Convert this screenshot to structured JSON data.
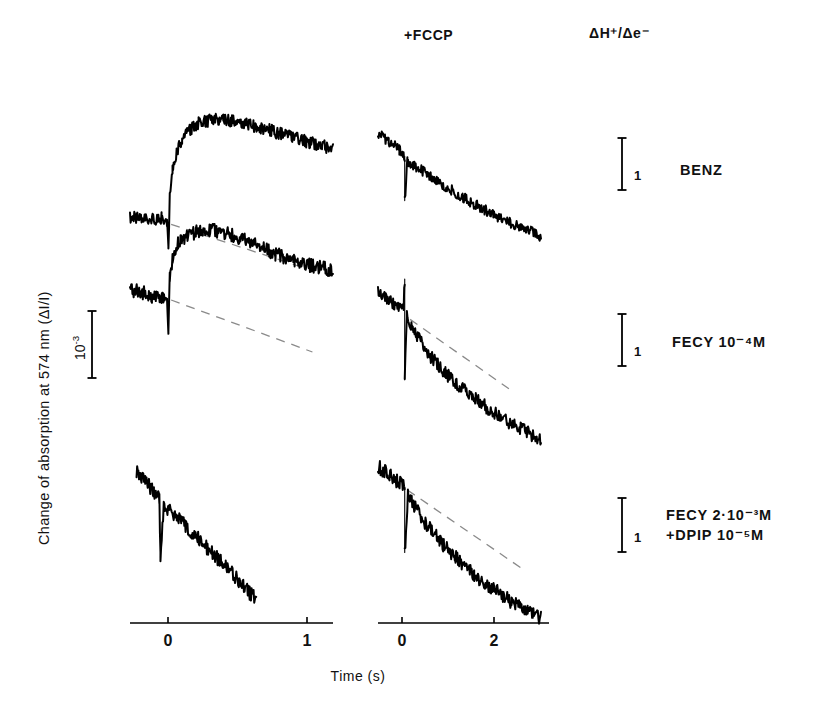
{
  "figure": {
    "axes": {
      "y_label": "Change of absorption at 574 nm (ΔI/I)",
      "y_scale_value": "10",
      "y_scale_exponent": "-3",
      "x_title": "Time (s)",
      "left_ticks": [
        "0",
        "1"
      ],
      "right_ticks": [
        "0",
        "2"
      ]
    },
    "column_headers": {
      "left": "",
      "middle": "+FCCP",
      "right": "ΔH⁺/Δe⁻"
    },
    "rows": [
      {
        "id": "benz",
        "label_lines": [
          "BENZ"
        ],
        "scale_bar_label": "1"
      },
      {
        "id": "fecy-1e-4",
        "label_lines": [
          "FECY 10⁻⁴M"
        ],
        "scale_bar_label": "1"
      },
      {
        "id": "fecy-2e-3-dpip",
        "label_lines": [
          "FECY 2·10⁻³M",
          "+DPIP 10⁻⁵M"
        ],
        "scale_bar_label": "1"
      }
    ]
  },
  "chart_data": {
    "type": "line",
    "title": "",
    "xlabel": "Time (s)",
    "ylabel": "Change of absorption at 574 nm (ΔI/I)",
    "grid": false,
    "legend_position": "right",
    "panels": [
      {
        "row": "BENZ",
        "column": "control",
        "xlim": [
          -0.28,
          1.2
        ],
        "xticks": [
          0,
          1
        ],
        "trace_kind": "spike-rise-plateau-decay",
        "noise_amplitude": 0.06,
        "points": [
          [
            -0.28,
            0.0
          ],
          [
            -0.2,
            0.01
          ],
          [
            -0.12,
            -0.01
          ],
          [
            -0.05,
            0.0
          ],
          [
            -0.01,
            -0.02
          ],
          [
            0.0,
            -0.3
          ],
          [
            0.01,
            0.2
          ],
          [
            0.03,
            0.45
          ],
          [
            0.06,
            0.62
          ],
          [
            0.1,
            0.75
          ],
          [
            0.15,
            0.84
          ],
          [
            0.22,
            0.9
          ],
          [
            0.3,
            0.93
          ],
          [
            0.4,
            0.94
          ],
          [
            0.5,
            0.92
          ],
          [
            0.62,
            0.88
          ],
          [
            0.75,
            0.83
          ],
          [
            0.88,
            0.78
          ],
          [
            1.0,
            0.73
          ],
          [
            1.12,
            0.69
          ],
          [
            1.2,
            0.66
          ]
        ],
        "dashed_baseline": [
          [
            0.02,
            -0.06
          ],
          [
            1.0,
            -0.48
          ]
        ]
      },
      {
        "row": "BENZ",
        "column": "+FCCP",
        "xlim": [
          -0.5,
          2.7
        ],
        "xticks": [
          0,
          2
        ],
        "trace_kind": "linear-decay-with-spike",
        "noise_amplitude": 0.05,
        "points": [
          [
            -0.5,
            0.92
          ],
          [
            -0.3,
            0.85
          ],
          [
            -0.1,
            0.76
          ],
          [
            0.0,
            0.7
          ],
          [
            0.0,
            0.28
          ],
          [
            0.05,
            0.66
          ],
          [
            0.3,
            0.57
          ],
          [
            0.6,
            0.47
          ],
          [
            1.0,
            0.34
          ],
          [
            1.4,
            0.22
          ],
          [
            1.8,
            0.11
          ],
          [
            2.2,
            0.02
          ],
          [
            2.55,
            -0.06
          ]
        ],
        "dashed_baseline": null
      },
      {
        "row": "FECY 10-4M",
        "column": "control",
        "xlim": [
          -0.28,
          1.2
        ],
        "xticks": [
          0,
          1
        ],
        "trace_kind": "spike-rise-plateau-decay",
        "noise_amplitude": 0.07,
        "points": [
          [
            -0.28,
            0.1
          ],
          [
            -0.2,
            0.08
          ],
          [
            -0.12,
            0.04
          ],
          [
            -0.05,
            0.02
          ],
          [
            -0.01,
            0.0
          ],
          [
            0.0,
            -0.38
          ],
          [
            0.01,
            0.22
          ],
          [
            0.03,
            0.42
          ],
          [
            0.07,
            0.56
          ],
          [
            0.13,
            0.64
          ],
          [
            0.2,
            0.68
          ],
          [
            0.3,
            0.7
          ],
          [
            0.4,
            0.68
          ],
          [
            0.52,
            0.62
          ],
          [
            0.65,
            0.54
          ],
          [
            0.78,
            0.46
          ],
          [
            0.92,
            0.39
          ],
          [
            1.05,
            0.34
          ],
          [
            1.15,
            0.31
          ],
          [
            1.2,
            0.3
          ]
        ],
        "dashed_baseline": [
          [
            0.02,
            0.0
          ],
          [
            1.05,
            -0.52
          ]
        ]
      },
      {
        "row": "FECY 10-4M",
        "column": "+FCCP",
        "xlim": [
          -0.5,
          2.7
        ],
        "xticks": [
          0,
          2
        ],
        "trace_kind": "biphasic-decay",
        "noise_amplitude": 0.06,
        "points": [
          [
            -0.5,
            0.95
          ],
          [
            -0.32,
            0.9
          ],
          [
            -0.16,
            0.85
          ],
          [
            -0.02,
            0.81
          ],
          [
            0.0,
            1.08
          ],
          [
            0.0,
            0.18
          ],
          [
            0.04,
            0.74
          ],
          [
            0.15,
            0.64
          ],
          [
            0.3,
            0.52
          ],
          [
            0.5,
            0.38
          ],
          [
            0.75,
            0.24
          ],
          [
            1.05,
            0.11
          ],
          [
            1.4,
            -0.02
          ],
          [
            1.75,
            -0.14
          ],
          [
            2.1,
            -0.24
          ],
          [
            2.4,
            -0.32
          ],
          [
            2.55,
            -0.35
          ]
        ],
        "dashed_baseline": [
          [
            0.1,
            0.72
          ],
          [
            1.95,
            0.1
          ]
        ]
      },
      {
        "row": "FECY 2.10-3M + DPIP 10-5M",
        "column": "control",
        "xlim": [
          -0.28,
          1.2
        ],
        "xticks": [
          0,
          1
        ],
        "trace_kind": "linear-decay-with-spike",
        "noise_amplitude": 0.055,
        "points": [
          [
            -0.22,
            0.98
          ],
          [
            -0.14,
            0.9
          ],
          [
            -0.06,
            0.82
          ],
          [
            -0.01,
            0.76
          ],
          [
            0.0,
            0.3
          ],
          [
            0.03,
            0.72
          ],
          [
            0.15,
            0.62
          ],
          [
            0.3,
            0.5
          ],
          [
            0.45,
            0.37
          ],
          [
            0.6,
            0.24
          ],
          [
            0.72,
            0.13
          ],
          [
            0.82,
            0.04
          ],
          [
            0.88,
            -0.01
          ]
        ],
        "dashed_baseline": null
      },
      {
        "row": "FECY 2.10-3M + DPIP 10-5M",
        "column": "+FCCP",
        "xlim": [
          -0.5,
          2.7
        ],
        "xticks": [
          0,
          2
        ],
        "trace_kind": "biphasic-decay",
        "noise_amplitude": 0.055,
        "points": [
          [
            -0.5,
            0.98
          ],
          [
            -0.32,
            0.93
          ],
          [
            -0.18,
            0.88
          ],
          [
            -0.05,
            0.84
          ],
          [
            0.0,
            0.82
          ],
          [
            0.0,
            0.32
          ],
          [
            0.06,
            0.76
          ],
          [
            0.2,
            0.66
          ],
          [
            0.4,
            0.54
          ],
          [
            0.65,
            0.41
          ],
          [
            0.95,
            0.28
          ],
          [
            1.3,
            0.15
          ],
          [
            1.65,
            0.04
          ],
          [
            2.0,
            -0.06
          ],
          [
            2.3,
            -0.14
          ],
          [
            2.55,
            -0.19
          ]
        ],
        "dashed_baseline": [
          [
            0.05,
            0.8
          ],
          [
            2.25,
            0.18
          ]
        ]
      }
    ]
  }
}
